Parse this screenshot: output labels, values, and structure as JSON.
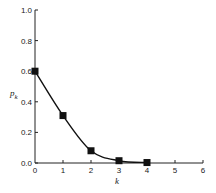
{
  "chart_data": {
    "type": "line",
    "title": "",
    "xlabel": "k",
    "ylabel": "p_k",
    "xlim": [
      0,
      6
    ],
    "ylim": [
      0.0,
      1.0
    ],
    "x_ticks": [
      "0",
      "1",
      "2",
      "3",
      "4",
      "5",
      "6"
    ],
    "y_ticks": [
      "0.0",
      "0.2",
      "0.4",
      "0.6",
      "0.8",
      "1.0"
    ],
    "grid": false,
    "legend": null,
    "series": [
      {
        "name": "p_k",
        "marker": "square",
        "line": "smooth",
        "x": [
          0,
          1,
          2,
          3,
          4
        ],
        "values": [
          0.6,
          0.31,
          0.08,
          0.015,
          0.003
        ]
      }
    ]
  }
}
